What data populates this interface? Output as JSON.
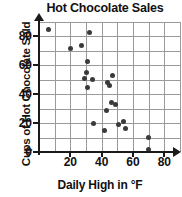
{
  "chart_data": {
    "type": "scatter",
    "title": "Hot Chocolate Sales",
    "xlabel": "Daily High in °F",
    "ylabel": "Cups of Hot Chocolate Sold",
    "xlim": [
      0,
      90
    ],
    "ylim": [
      0,
      90
    ],
    "xticks": [
      20,
      40,
      60,
      80
    ],
    "yticks": [
      0,
      20,
      40,
      60,
      80
    ],
    "xtick_labels": [
      "20",
      "40",
      "60",
      "80"
    ],
    "ytick_labels": [
      "0",
      "20",
      "40",
      "60",
      "80"
    ],
    "grid": true,
    "legend": "none",
    "marker_color": "#3a3a3a",
    "axis_color": "#1a1a1a",
    "grid_color": "#9a9a9a",
    "points": [
      {
        "x": 6,
        "y": 85
      },
      {
        "x": 32,
        "y": 83
      },
      {
        "x": 20,
        "y": 72
      },
      {
        "x": 27,
        "y": 74
      },
      {
        "x": 31,
        "y": 63
      },
      {
        "x": 30,
        "y": 55
      },
      {
        "x": 29,
        "y": 51
      },
      {
        "x": 34,
        "y": 50
      },
      {
        "x": 31,
        "y": 45
      },
      {
        "x": 47,
        "y": 53
      },
      {
        "x": 44,
        "y": 48
      },
      {
        "x": 45,
        "y": 46
      },
      {
        "x": 46,
        "y": 34
      },
      {
        "x": 49,
        "y": 33
      },
      {
        "x": 43,
        "y": 29
      },
      {
        "x": 35,
        "y": 20
      },
      {
        "x": 54,
        "y": 21
      },
      {
        "x": 51,
        "y": 19
      },
      {
        "x": 55,
        "y": 16
      },
      {
        "x": 42,
        "y": 15
      },
      {
        "x": 70,
        "y": 10
      },
      {
        "x": 70,
        "y": 2
      }
    ]
  }
}
